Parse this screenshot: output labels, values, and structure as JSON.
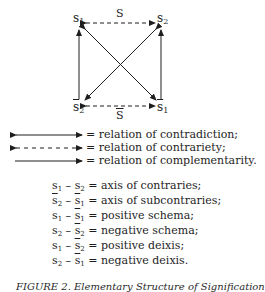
{
  "diagram": {
    "type": "semiotic-square",
    "nodes": {
      "top_left": {
        "base": "s",
        "sub": "1",
        "bar": false
      },
      "top_right": {
        "base": "s",
        "sub": "2",
        "bar": false
      },
      "bottom_left": {
        "base": "s",
        "sub": "2",
        "bar": true
      },
      "bottom_right": {
        "base": "s",
        "sub": "1",
        "bar": true
      }
    },
    "edge_labels": {
      "top": "S",
      "bottom": "S"
    },
    "edges": [
      {
        "from": "s1",
        "to": "s2",
        "style": "dashed",
        "direction": "both",
        "relation": "contrariety"
      },
      {
        "from": "s̄2",
        "to": "s̄1",
        "style": "dashed",
        "direction": "both",
        "relation": "contrariety"
      },
      {
        "from": "s1",
        "to": "s̄1",
        "style": "solid",
        "direction": "both",
        "relation": "contradiction"
      },
      {
        "from": "s2",
        "to": "s̄2",
        "style": "solid",
        "direction": "both",
        "relation": "contradiction"
      },
      {
        "from": "s̄2",
        "to": "s1",
        "style": "solid",
        "direction": "one-way",
        "relation": "complementarity"
      },
      {
        "from": "s̄1",
        "to": "s2",
        "style": "solid",
        "direction": "one-way",
        "relation": "complementarity"
      }
    ]
  },
  "legend": [
    {
      "arrow": "solid-double",
      "text": "= relation of contradiction;"
    },
    {
      "arrow": "dashed-double",
      "text": "= relation of contrariety;"
    },
    {
      "arrow": "solid-single",
      "text": "= relation of complementarity."
    }
  ],
  "definitions": [
    {
      "a": {
        "base": "s",
        "sub": "1",
        "bar": false
      },
      "b": {
        "base": "s",
        "sub": "2",
        "bar": false
      },
      "text": "= axis of contraries;"
    },
    {
      "a": {
        "base": "s",
        "sub": "2",
        "bar": true
      },
      "b": {
        "base": "s",
        "sub": "1",
        "bar": true
      },
      "text": "= axis of subcontraries;"
    },
    {
      "a": {
        "base": "s",
        "sub": "1",
        "bar": false
      },
      "b": {
        "base": "s",
        "sub": "1",
        "bar": true
      },
      "text": "= positive schema;"
    },
    {
      "a": {
        "base": "s",
        "sub": "2",
        "bar": false
      },
      "b": {
        "base": "s",
        "sub": "2",
        "bar": true
      },
      "text": "= negative schema;"
    },
    {
      "a": {
        "base": "s",
        "sub": "1",
        "bar": false
      },
      "b": {
        "base": "s",
        "sub": "2",
        "bar": true
      },
      "text": "= positive deixis;"
    },
    {
      "a": {
        "base": "s",
        "sub": "2",
        "bar": false
      },
      "b": {
        "base": "s",
        "sub": "1",
        "bar": true
      },
      "text": "= negative deixis."
    }
  ],
  "caption": "FIGURE 2. Elementary Structure of Signification"
}
